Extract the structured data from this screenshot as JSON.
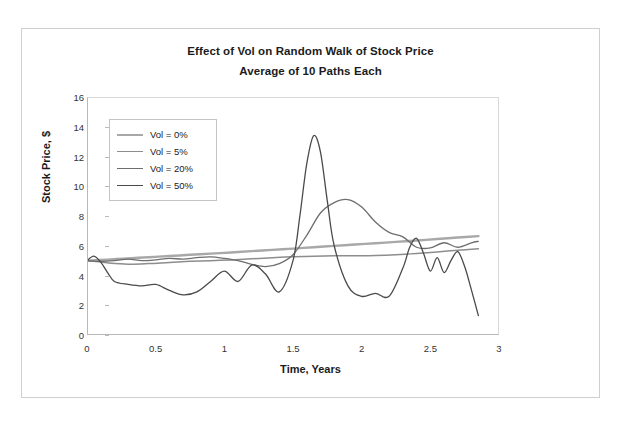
{
  "chart_data": {
    "type": "line",
    "title": "Effect of Vol on Random Walk of Stock Price",
    "subtitle": "Average of 10 Paths Each",
    "xlabel": "Time, Years",
    "ylabel": "Stock Price, $",
    "xlim": [
      0,
      3
    ],
    "ylim": [
      0,
      16
    ],
    "xticks": [
      "0",
      "0.5",
      "1",
      "1.5",
      "2",
      "2.5",
      "3"
    ],
    "xtick_values": [
      0,
      0.5,
      1,
      1.5,
      2,
      2.5,
      3
    ],
    "yticks": [
      "0",
      "2",
      "4",
      "6",
      "8",
      "10",
      "12",
      "14",
      "16"
    ],
    "ytick_values": [
      0,
      2,
      4,
      6,
      8,
      10,
      12,
      14,
      16
    ],
    "grid": false,
    "legend_position": "upper-left",
    "series": [
      {
        "name": "Vol = 0%",
        "color": "#a8a8a8",
        "width": 2.4,
        "x": [
          0.0,
          0.15,
          0.3,
          0.45,
          0.6,
          0.75,
          0.9,
          1.05,
          1.2,
          1.35,
          1.5,
          1.65,
          1.8,
          1.95,
          2.1,
          2.25,
          2.4,
          2.55,
          2.7,
          2.85
        ],
        "y": [
          5.0,
          5.07,
          5.15,
          5.23,
          5.31,
          5.39,
          5.47,
          5.55,
          5.64,
          5.72,
          5.81,
          5.9,
          5.99,
          6.08,
          6.17,
          6.26,
          6.35,
          6.45,
          6.55,
          6.65
        ]
      },
      {
        "name": "Vol = 5%",
        "color": "#8d8d8d",
        "width": 1.5,
        "x": [
          0.0,
          0.15,
          0.3,
          0.45,
          0.6,
          0.75,
          0.9,
          1.05,
          1.2,
          1.35,
          1.5,
          1.65,
          1.8,
          1.95,
          2.1,
          2.25,
          2.4,
          2.55,
          2.7,
          2.85
        ],
        "y": [
          5.0,
          4.85,
          4.76,
          4.8,
          4.88,
          4.95,
          5.0,
          5.05,
          5.12,
          5.2,
          5.26,
          5.3,
          5.32,
          5.33,
          5.35,
          5.4,
          5.48,
          5.58,
          5.7,
          5.8
        ]
      },
      {
        "name": "Vol = 20%",
        "color": "#6e6e6e",
        "width": 1.3,
        "x": [
          0.0,
          0.1,
          0.2,
          0.3,
          0.4,
          0.5,
          0.6,
          0.7,
          0.8,
          0.9,
          1.0,
          1.1,
          1.2,
          1.3,
          1.4,
          1.5,
          1.6,
          1.7,
          1.8,
          1.9,
          2.0,
          2.1,
          2.2,
          2.3,
          2.4,
          2.5,
          2.6,
          2.7,
          2.8,
          2.85
        ],
        "y": [
          5.0,
          4.95,
          5.0,
          5.1,
          5.0,
          5.05,
          5.15,
          5.1,
          5.2,
          5.25,
          5.15,
          5.0,
          4.75,
          4.6,
          4.8,
          5.4,
          6.7,
          8.2,
          8.9,
          9.1,
          8.6,
          7.6,
          6.9,
          6.6,
          5.9,
          5.85,
          6.2,
          5.9,
          6.2,
          6.3
        ]
      },
      {
        "name": "Vol = 50%",
        "color": "#4a4a4a",
        "width": 1.3,
        "x": [
          0.0,
          0.05,
          0.1,
          0.15,
          0.2,
          0.3,
          0.4,
          0.5,
          0.6,
          0.7,
          0.8,
          0.9,
          1.0,
          1.1,
          1.2,
          1.3,
          1.4,
          1.5,
          1.55,
          1.6,
          1.65,
          1.7,
          1.75,
          1.8,
          1.9,
          2.0,
          2.1,
          2.2,
          2.3,
          2.35,
          2.4,
          2.45,
          2.5,
          2.55,
          2.6,
          2.65,
          2.7,
          2.75,
          2.8,
          2.85
        ],
        "y": [
          5.0,
          5.3,
          4.9,
          4.2,
          3.6,
          3.4,
          3.3,
          3.4,
          3.0,
          2.7,
          2.9,
          3.6,
          4.3,
          3.6,
          4.7,
          4.1,
          2.9,
          5.0,
          8.0,
          11.5,
          13.4,
          12.3,
          9.0,
          6.0,
          3.3,
          2.6,
          2.8,
          2.6,
          4.5,
          5.9,
          6.5,
          5.5,
          4.3,
          5.2,
          4.2,
          5.0,
          5.6,
          4.6,
          3.0,
          1.3
        ]
      }
    ]
  },
  "legend": {
    "items": [
      {
        "label": "Vol = 0%"
      },
      {
        "label": "Vol = 5%"
      },
      {
        "label": "Vol = 20%"
      },
      {
        "label": "Vol = 50%"
      }
    ]
  }
}
